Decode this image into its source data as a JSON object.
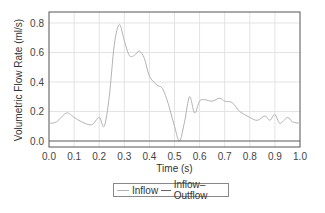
{
  "chart_data": {
    "type": "line",
    "title": "",
    "xlabel": "Time (s)",
    "ylabel": "Volumetric Flow Rate (ml/s)",
    "xlim": [
      0.0,
      1.0
    ],
    "ylim": [
      -0.02,
      0.86
    ],
    "xticks": [
      "0.0",
      "0.1",
      "0.2",
      "0.3",
      "0.4",
      "0.5",
      "0.6",
      "0.7",
      "0.8",
      "0.9",
      "1.0"
    ],
    "yticks": [
      "0.0",
      "0.2",
      "0.4",
      "0.6",
      "0.8"
    ],
    "grid": true,
    "legend_position": "bottom-center",
    "series": [
      {
        "name": "Inflow",
        "color": "#b3b3b3",
        "x": [
          0.0,
          0.03,
          0.07,
          0.1,
          0.13,
          0.17,
          0.2,
          0.22,
          0.24,
          0.26,
          0.28,
          0.3,
          0.32,
          0.34,
          0.36,
          0.38,
          0.4,
          0.43,
          0.45,
          0.47,
          0.5,
          0.52,
          0.54,
          0.56,
          0.58,
          0.6,
          0.62,
          0.65,
          0.68,
          0.7,
          0.73,
          0.76,
          0.8,
          0.83,
          0.86,
          0.88,
          0.9,
          0.92,
          0.95,
          0.97,
          1.0
        ],
        "values": [
          0.12,
          0.13,
          0.19,
          0.16,
          0.13,
          0.11,
          0.16,
          0.1,
          0.3,
          0.65,
          0.79,
          0.68,
          0.58,
          0.58,
          0.61,
          0.56,
          0.44,
          0.38,
          0.36,
          0.28,
          0.1,
          0.0,
          0.13,
          0.3,
          0.19,
          0.27,
          0.28,
          0.27,
          0.29,
          0.27,
          0.26,
          0.2,
          0.16,
          0.14,
          0.17,
          0.14,
          0.18,
          0.12,
          0.16,
          0.13,
          0.12
        ]
      },
      {
        "name": "Inflow–Outflow",
        "color": "#666666",
        "x": [
          0.0,
          1.0
        ],
        "values": [
          0.0,
          0.0
        ]
      }
    ]
  },
  "legend": {
    "items": [
      {
        "label": "Inflow",
        "color": "#b3b3b3"
      },
      {
        "label": "Inflow–Outflow",
        "color": "#666666"
      }
    ]
  }
}
